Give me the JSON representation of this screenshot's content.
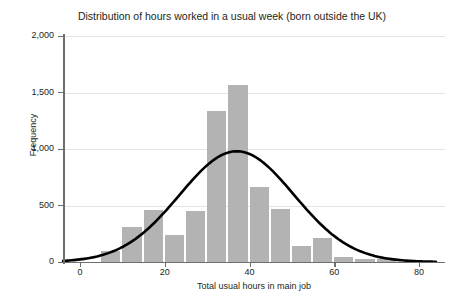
{
  "top_clipped_text": "",
  "chart_data": {
    "type": "bar",
    "title": "Distribution of hours worked in a usual week (born outside the UK)",
    "xlabel": "Total usual hours in main job",
    "ylabel": "Frequency",
    "xlim": [
      -4,
      84
    ],
    "ylim": [
      0,
      2000
    ],
    "grid": true,
    "legend": "none",
    "bin_width": 5,
    "xticks": [
      0,
      20,
      40,
      60,
      80
    ],
    "xtick_labels": [
      "0",
      "20",
      "40",
      "60",
      "80"
    ],
    "yticks": [
      0,
      500,
      1000,
      1500,
      2000
    ],
    "ytick_labels": [
      "0",
      "500",
      "1,000",
      "1,500",
      "2,000"
    ],
    "bar_color": "#b3b3b3",
    "curve_color": "#000000",
    "bin_starts": [
      5,
      10,
      15,
      20,
      25,
      30,
      35,
      40,
      45,
      50,
      55,
      60,
      65,
      70
    ],
    "bin_centers": [
      7.5,
      12.5,
      17.5,
      22.5,
      27.5,
      32.5,
      37.5,
      42.5,
      47.5,
      52.5,
      57.5,
      62.5,
      67.5,
      72.5
    ],
    "categories": [
      "5-10",
      "10-15",
      "15-20",
      "20-25",
      "25-30",
      "30-35",
      "35-40",
      "40-45",
      "45-50",
      "50-55",
      "55-60",
      "60-65",
      "65-70",
      "70-75"
    ],
    "values": [
      95,
      310,
      460,
      240,
      450,
      1340,
      1570,
      660,
      470,
      140,
      215,
      40,
      30,
      25
    ],
    "series": [
      {
        "name": "Frequency",
        "values": [
          95,
          310,
          460,
          240,
          450,
          1340,
          1570,
          660,
          470,
          140,
          215,
          40,
          30,
          25
        ]
      }
    ],
    "overlay_curve": {
      "name": "Normal distribution fit",
      "type": "line",
      "mean": 37,
      "sigma": 13.5,
      "peak": 980
    }
  }
}
